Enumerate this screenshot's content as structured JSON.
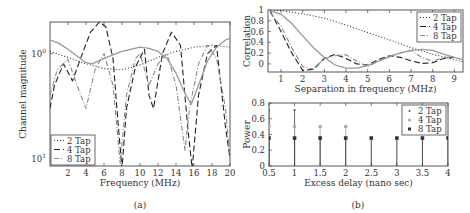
{
  "chart_data": [
    {
      "id": "a",
      "type": "line",
      "caption": "(a)",
      "xlabel": "Frequency (MHz)",
      "ylabel": "Channel magnitude",
      "xlim": [
        0,
        20
      ],
      "xticks": [
        2,
        4,
        6,
        8,
        10,
        12,
        14,
        16,
        18,
        20
      ],
      "yscale": "log",
      "ytick_labels": [
        {
          "label": "10",
          "exp": "0",
          "value": 1.0
        },
        {
          "label": "10",
          "exp": "1",
          "value": 0.1
        }
      ],
      "ylim": [
        0.085,
        2.0
      ],
      "legend": {
        "position": "lower left",
        "entries": [
          "2 Tap",
          "4 Tap",
          "8 Tap"
        ]
      },
      "series": [
        {
          "name": "2 Tap",
          "style": "dotted",
          "color": "#333333",
          "x": [
            0,
            2,
            4,
            6,
            8,
            10,
            12,
            14,
            16,
            18,
            20
          ],
          "y": [
            1.05,
            0.92,
            0.8,
            0.72,
            0.7,
            0.78,
            0.92,
            1.05,
            1.15,
            1.2,
            1.15
          ]
        },
        {
          "name": "4 Tap",
          "style": "dashed",
          "color": "#222222",
          "x": [
            0,
            0.5,
            1.5,
            2.5,
            3.5,
            4.5,
            5.5,
            6.2,
            7,
            7.6,
            8,
            8.5,
            9.5,
            10.5,
            11,
            11.5,
            12.5,
            13.5,
            14.5,
            15.3,
            15.8,
            16.5,
            17.5,
            18.5,
            19.5,
            20
          ],
          "y": [
            0.3,
            0.5,
            0.8,
            0.55,
            0.95,
            1.6,
            2.0,
            1.8,
            0.9,
            0.2,
            0.08,
            0.3,
            0.75,
            1.1,
            0.4,
            0.3,
            1.0,
            1.6,
            1.2,
            0.2,
            0.08,
            0.4,
            1.0,
            1.2,
            0.2,
            0.1
          ]
        },
        {
          "name": "8 Tap",
          "style": "dashdot",
          "color": "#888888",
          "x": [
            0,
            0.8,
            2,
            3,
            4,
            5,
            6,
            7,
            7.8,
            8.5,
            9.5,
            10,
            11,
            12,
            13,
            14,
            15,
            15.5,
            16.5,
            17.5,
            18.5,
            19.5,
            20
          ],
          "y": [
            0.4,
            0.7,
            0.88,
            0.5,
            0.3,
            0.7,
            1.0,
            0.5,
            0.09,
            0.4,
            0.9,
            1.0,
            0.5,
            0.8,
            1.0,
            0.5,
            0.12,
            0.3,
            0.8,
            1.2,
            0.9,
            0.3,
            0.1
          ]
        },
        {
          "name": "reference (solid)",
          "style": "solid",
          "color": "#999999",
          "x": [
            0,
            1,
            2,
            3,
            4,
            4.7,
            6,
            8,
            10,
            11,
            12,
            13,
            14,
            15,
            15.7,
            16.5,
            17.5,
            18.5,
            19.5,
            20
          ],
          "y": [
            1.35,
            1.25,
            1.1,
            0.95,
            0.82,
            0.8,
            0.9,
            1.05,
            1.15,
            1.12,
            1.05,
            0.9,
            0.65,
            0.42,
            0.33,
            0.5,
            0.85,
            1.15,
            1.35,
            1.4
          ]
        }
      ]
    },
    {
      "id": "b-top",
      "type": "line",
      "xlabel": "Separation in frequency (MHz)",
      "ylabel": "Correlation",
      "xlim": [
        0.4,
        9.4
      ],
      "xticks": [
        1,
        2,
        3,
        4,
        5,
        6,
        7,
        8,
        9
      ],
      "ylim": [
        -0.15,
        1.0
      ],
      "yticks": [
        0,
        0.2,
        0.4,
        0.6,
        0.8,
        1
      ],
      "ytick_labels": [
        "0",
        "0.2",
        "0.4",
        "0.6",
        "0.8",
        "1"
      ],
      "legend": {
        "position": "upper right",
        "entries": [
          "2 Tap",
          "4 Tap",
          "8 Tap"
        ]
      },
      "series": [
        {
          "name": "2 Tap",
          "style": "dotted",
          "color": "#333333",
          "x": [
            0.4,
            1,
            2,
            3,
            4,
            5,
            6,
            7,
            8,
            9,
            9.4
          ],
          "y": [
            1.0,
            0.99,
            0.93,
            0.85,
            0.72,
            0.58,
            0.45,
            0.3,
            0.18,
            0.08,
            0.04
          ]
        },
        {
          "name": "4 Tap",
          "style": "dashed",
          "color": "#222222",
          "x": [
            0.5,
            1,
            1.5,
            2,
            2.5,
            3,
            3.5,
            4,
            4.5,
            5,
            5.5,
            6,
            6.5,
            7,
            7.5,
            8,
            8.5,
            9
          ],
          "y": [
            0.98,
            0.6,
            0.2,
            -0.12,
            -0.1,
            0.1,
            0.18,
            0.1,
            0.0,
            -0.02,
            0.08,
            0.15,
            0.12,
            0.06,
            0.01,
            0.02,
            0.1,
            0.12
          ]
        },
        {
          "name": "8 Tap",
          "style": "dashdot",
          "color": "#888888",
          "x": [
            0.5,
            1,
            1.5,
            2,
            2.5,
            3,
            3.5,
            4,
            4.5,
            5,
            5.5,
            6,
            6.5,
            7,
            7.5,
            8,
            8.5,
            9
          ],
          "y": [
            0.95,
            0.7,
            0.3,
            -0.05,
            -0.1,
            0.1,
            0.15,
            0.17,
            0.05,
            -0.05,
            0.05,
            0.15,
            0.2,
            0.25,
            0.12,
            0.05,
            0.12,
            0.12
          ]
        },
        {
          "name": "reference (solid)",
          "style": "solid",
          "color": "#999999",
          "x": [
            0.4,
            1,
            1.5,
            2,
            2.5,
            3,
            3.5,
            4,
            4.5,
            5,
            5.5,
            6,
            6.5,
            7,
            7.5,
            8,
            8.5,
            9,
            9.4
          ],
          "y": [
            1.0,
            0.92,
            0.75,
            0.52,
            0.3,
            0.12,
            -0.02,
            -0.08,
            -0.08,
            -0.03,
            0.05,
            0.13,
            0.2,
            0.25,
            0.27,
            0.25,
            0.18,
            0.12,
            0.08
          ]
        }
      ]
    },
    {
      "id": "b-bottom",
      "type": "stem",
      "caption": "(b)",
      "xlabel": "Excess delay (nano sec)",
      "ylabel": "Power",
      "xlim": [
        0.5,
        4
      ],
      "xticks": [
        0.5,
        1,
        1.5,
        2,
        2.5,
        3,
        3.5,
        4
      ],
      "xtick_labels": [
        "0.5",
        "1",
        "1.5",
        "2",
        "2.5",
        "3",
        "3.5",
        "4"
      ],
      "ylim": [
        0,
        0.8
      ],
      "yticks": [
        0,
        0.2,
        0.4,
        0.6,
        0.8
      ],
      "ytick_labels": [
        "0",
        "0.2",
        "0.4",
        "0.6",
        "0.8"
      ],
      "legend": {
        "position": "upper right",
        "entries": [
          "2 Tap",
          "4 Tap",
          "8 Tap"
        ]
      },
      "series": [
        {
          "name": "2 Tap",
          "marker": "dot",
          "color": "#555555",
          "x": [
            0.5,
            1
          ],
          "y": [
            0.71,
            0.71
          ]
        },
        {
          "name": "4 Tap",
          "marker": "circle",
          "color": "#aaaaaa",
          "x": [
            0.5,
            1,
            1.5,
            2
          ],
          "y": [
            0.5,
            0.5,
            0.5,
            0.5
          ]
        },
        {
          "name": "8 Tap",
          "marker": "square",
          "color": "#333333",
          "x": [
            0.5,
            1,
            1.5,
            2,
            2.5,
            3,
            3.5,
            4
          ],
          "y": [
            0.355,
            0.355,
            0.355,
            0.355,
            0.355,
            0.355,
            0.355,
            0.355
          ]
        }
      ]
    }
  ]
}
